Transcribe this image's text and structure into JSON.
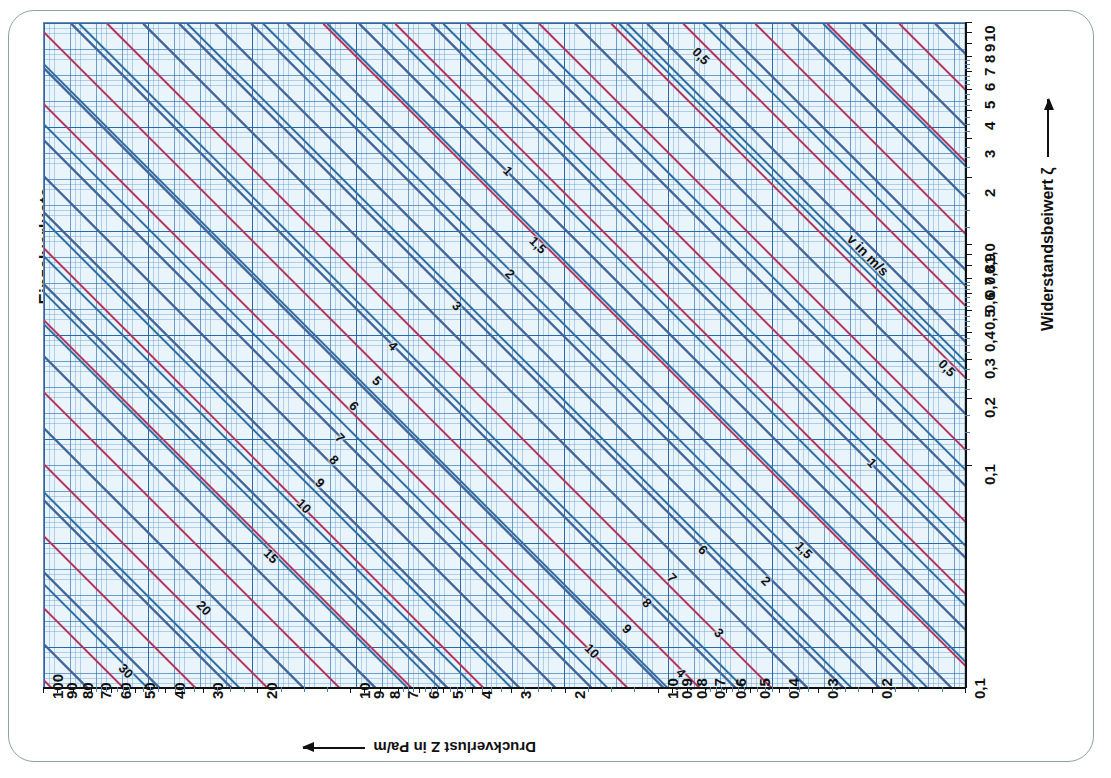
{
  "page": {
    "title": "Einzelverluste",
    "frame_color": "#8fa39b",
    "background": "#ffffff"
  },
  "chart_data": {
    "type": "line",
    "title": "Einzelverluste",
    "xlabel": "Druckverlust Z in Pa/m",
    "ylabel": "Widerstandsbeiwert ζ",
    "x_axis": {
      "label": "Druckverlust Z in Pa/m",
      "arrow": "left",
      "scale": "log-reversed",
      "min": 0.1,
      "max": 100,
      "ticks": [
        "100",
        "90",
        "80",
        "70",
        "60",
        "50",
        "40",
        "30",
        "20",
        "10",
        "9",
        "8",
        "7",
        "6",
        "5",
        "4",
        "3",
        "2",
        "1,0",
        "0,9",
        "0,8",
        "0,7",
        "0,6",
        "0,5",
        "0,4",
        "0,3",
        "0,2",
        "0,1"
      ]
    },
    "y_axis": {
      "label": "Widerstandsbeiwert ζ",
      "arrow": "up",
      "scale": "log",
      "min": 0.1,
      "max": 10,
      "ticks": [
        "10",
        "9",
        "8",
        "7",
        "6",
        "5",
        "4",
        "3",
        "2",
        "1,0",
        "0,9",
        "0,8",
        "0,7",
        "0,6",
        "0,5",
        "0,4",
        "0,3",
        "0,2",
        "0,1"
      ]
    },
    "grid": true,
    "legend_position": "inline",
    "series": [
      {
        "name": "v in m/s",
        "note": "Blue diagonal lines: air velocity v in m/s",
        "color": "#2f6ea4",
        "labels": [
          "0,5",
          "1",
          "1,5",
          "2",
          "3",
          "4",
          "5",
          "6",
          "7",
          "8",
          "9",
          "10",
          "15",
          "20",
          "30"
        ]
      },
      {
        "name": "red auxiliary lines",
        "note": "Red diagonal lines: intermediate auxiliary family",
        "color": "#b7335c",
        "labels": []
      }
    ],
    "annotations": [
      {
        "text": "v in m/s",
        "on": "blue-line"
      },
      {
        "text": "0,5",
        "on": "blue-line"
      },
      {
        "text": "1",
        "on": "blue-line"
      },
      {
        "text": "1,5",
        "on": "blue-line"
      },
      {
        "text": "2",
        "on": "blue-line"
      },
      {
        "text": "3",
        "on": "blue-line"
      },
      {
        "text": "4",
        "on": "blue-line"
      },
      {
        "text": "5",
        "on": "blue-line"
      },
      {
        "text": "6",
        "on": "blue-line"
      },
      {
        "text": "7",
        "on": "blue-line"
      },
      {
        "text": "8",
        "on": "blue-line"
      },
      {
        "text": "9",
        "on": "blue-line"
      },
      {
        "text": "10",
        "on": "blue-line"
      },
      {
        "text": "15",
        "on": "blue-line"
      },
      {
        "text": "20",
        "on": "blue-line"
      },
      {
        "text": "30",
        "on": "blue-line"
      }
    ]
  },
  "colors": {
    "red_line": "#b7335c",
    "blue_line": "#2f6ea4",
    "grid": "#5a96c8",
    "plot_bg": "#eaf4fb",
    "axis": "#111111"
  },
  "x_ticks": [
    {
      "label": "100",
      "pos": 0
    },
    {
      "label": "90",
      "pos": 1.52
    },
    {
      "label": "80",
      "pos": 3.23
    },
    {
      "label": "70",
      "pos": 5.17
    },
    {
      "label": "60",
      "pos": 7.4
    },
    {
      "label": "50",
      "pos": 10.03
    },
    {
      "label": "40",
      "pos": 13.22
    },
    {
      "label": "30",
      "pos": 17.39
    },
    {
      "label": "20",
      "pos": 23.25
    },
    {
      "label": "10",
      "pos": 33.33
    },
    {
      "label": "9",
      "pos": 34.85
    },
    {
      "label": "8",
      "pos": 36.56
    },
    {
      "label": "7",
      "pos": 38.5
    },
    {
      "label": "6",
      "pos": 40.73
    },
    {
      "label": "5",
      "pos": 43.36
    },
    {
      "label": "4",
      "pos": 46.55
    },
    {
      "label": "3",
      "pos": 50.72
    },
    {
      "label": "2",
      "pos": 56.58
    },
    {
      "label": "1,0",
      "pos": 66.67
    },
    {
      "label": "0,9",
      "pos": 68.19
    },
    {
      "label": "0,8",
      "pos": 69.9
    },
    {
      "label": "0,7",
      "pos": 71.83
    },
    {
      "label": "0,6",
      "pos": 74.06
    },
    {
      "label": "0,5",
      "pos": 76.69
    },
    {
      "label": "0,4",
      "pos": 79.88
    },
    {
      "label": "0,3",
      "pos": 84.06
    },
    {
      "label": "0,2",
      "pos": 89.91
    },
    {
      "label": "0,1",
      "pos": 100
    }
  ],
  "y_ticks": [
    {
      "label": "10",
      "pos": 0
    },
    {
      "label": "9",
      "pos": 1.52
    },
    {
      "label": "8",
      "pos": 3.23
    },
    {
      "label": "7",
      "pos": 5.17
    },
    {
      "label": "6",
      "pos": 7.4
    },
    {
      "label": "5",
      "pos": 10.03
    },
    {
      "label": "4",
      "pos": 13.22
    },
    {
      "label": "3",
      "pos": 17.39
    },
    {
      "label": "2",
      "pos": 23.25
    },
    {
      "label": "1,0",
      "pos": 33.33
    },
    {
      "label": "0,9",
      "pos": 34.85
    },
    {
      "label": "0,8",
      "pos": 36.56
    },
    {
      "label": "0,7",
      "pos": 38.5
    },
    {
      "label": "0,6",
      "pos": 40.73
    },
    {
      "label": "0,5",
      "pos": 43.36
    },
    {
      "label": "0,4",
      "pos": 46.55
    },
    {
      "label": "0,3",
      "pos": 50.72
    },
    {
      "label": "0,2",
      "pos": 56.58
    },
    {
      "label": "0,1",
      "pos": 66.67
    }
  ],
  "blue_lines": [
    {
      "label": "30",
      "offset": -560,
      "lx": 82,
      "ly": 648
    },
    {
      "label": "20",
      "offset": -468,
      "lx": 160,
      "ly": 585
    },
    {
      "label": "15",
      "offset": -404,
      "lx": 227,
      "ly": 533
    },
    {
      "label": "10",
      "offset": -300,
      "lx": 260,
      "ly": 483
    },
    {
      "label": "9",
      "offset": -268,
      "lx": 276,
      "ly": 460
    },
    {
      "label": "8",
      "offset": -232,
      "lx": 290,
      "ly": 437
    },
    {
      "label": "7",
      "offset": -196,
      "lx": 296,
      "ly": 415
    },
    {
      "label": "6",
      "offset": -152,
      "lx": 310,
      "ly": 383
    },
    {
      "label": "5",
      "offset": -100,
      "lx": 333,
      "ly": 358
    },
    {
      "label": "4",
      "offset": -40,
      "lx": 349,
      "ly": 323
    },
    {
      "label": "3",
      "offset": 36,
      "lx": 413,
      "ly": 283
    },
    {
      "label": "2",
      "offset": 144,
      "lx": 466,
      "ly": 251
    },
    {
      "label": "1,5",
      "offset": 220,
      "lx": 494,
      "ly": 222
    },
    {
      "label": "1",
      "offset": 340,
      "lx": 464,
      "ly": 148
    },
    {
      "label": "0,5",
      "offset": 576,
      "lx": 657,
      "ly": 33
    }
  ],
  "blue_lines_lower": [
    {
      "label": "10",
      "offset": 136,
      "lx": 548,
      "ly": 628
    },
    {
      "label": "9",
      "offset": 172,
      "lx": 583,
      "ly": 606
    },
    {
      "label": "8",
      "offset": 208,
      "lx": 603,
      "ly": 580
    },
    {
      "label": "7",
      "offset": 244,
      "lx": 628,
      "ly": 555
    },
    {
      "label": "6",
      "offset": 284,
      "lx": 659,
      "ly": 527
    },
    {
      "label": "5",
      "offset": 340,
      "lx": 610,
      "ly": 680
    },
    {
      "label": "4",
      "offset": 400,
      "lx": 637,
      "ly": 650
    },
    {
      "label": "3",
      "offset": 476,
      "lx": 675,
      "ly": 610
    },
    {
      "label": "2",
      "offset": 584,
      "lx": 722,
      "ly": 558
    },
    {
      "label": "1,5",
      "offset": 660,
      "lx": 760,
      "ly": 527
    },
    {
      "label": "1",
      "offset": 780,
      "lx": 828,
      "ly": 440
    },
    {
      "label": "0,5",
      "offset": 1016,
      "lx": 903,
      "ly": 345
    }
  ],
  "vlabel": {
    "text": "v in m/s",
    "lx": 824,
    "ly": 232
  }
}
